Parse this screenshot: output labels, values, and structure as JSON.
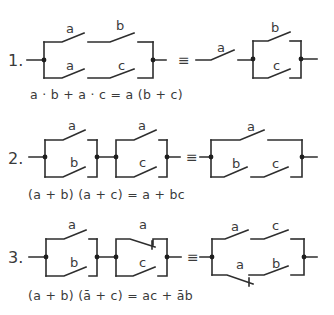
{
  "diagrams": [
    {
      "number": "1.",
      "equiv_symbol": "≡",
      "formula": "a · b + a · c = a (b + c)",
      "left_circuit": {
        "type": "parallel",
        "branches": [
          [
            "a",
            "b"
          ],
          [
            "a",
            "c"
          ]
        ]
      },
      "right_circuit": {
        "type": "series",
        "parts": [
          "a",
          {
            "parallel": [
              "b",
              "c"
            ]
          }
        ]
      },
      "labels": {
        "l_top_1": "a",
        "l_top_2": "b",
        "l_bot_1": "a",
        "l_bot_2": "c",
        "r_series": "a",
        "r_top": "b",
        "r_bot": "c"
      }
    },
    {
      "number": "2.",
      "equiv_symbol": "≡",
      "formula": "(a + b) (a + c) = a + bc",
      "left_circuit": {
        "type": "series",
        "parts": [
          {
            "parallel": [
              "a",
              "b"
            ]
          },
          {
            "parallel": [
              "a",
              "c"
            ]
          }
        ]
      },
      "right_circuit": {
        "type": "parallel",
        "branches": [
          [
            "a"
          ],
          [
            "b",
            "c"
          ]
        ]
      },
      "labels": {
        "b1_top": "a",
        "b1_bot": "b",
        "b2_top": "a",
        "b2_bot": "c",
        "r_top": "a",
        "r_bot_1": "b",
        "r_bot_2": "c"
      }
    },
    {
      "number": "3.",
      "equiv_symbol": "≡",
      "formula": "(a + b) (ā + c) = ac + āb",
      "left_circuit": {
        "type": "series",
        "parts": [
          {
            "parallel": [
              "a",
              "b"
            ]
          },
          {
            "parallel": [
              "ā (normally closed)",
              "c"
            ]
          }
        ]
      },
      "right_circuit": {
        "type": "parallel",
        "branches": [
          [
            "a",
            "c"
          ],
          [
            "ā (normally closed)",
            "b"
          ]
        ]
      },
      "labels": {
        "b1_top": "a",
        "b1_bot": "b",
        "b2_top": "a",
        "b2_bot": "c",
        "r_top_1": "a",
        "r_top_2": "c",
        "r_bot_1": "a",
        "r_bot_2": "b"
      }
    }
  ]
}
